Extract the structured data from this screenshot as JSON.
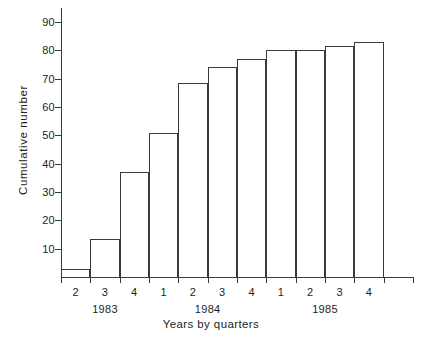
{
  "chart_data": {
    "type": "bar",
    "title": "",
    "xlabel": "Years by quarters",
    "ylabel": "Cumulative number",
    "categories": [
      "2",
      "3",
      "4",
      "1",
      "2",
      "3",
      "4",
      "1",
      "2",
      "3",
      "4"
    ],
    "group_labels": [
      "1983",
      "1984",
      "1985"
    ],
    "groups": [
      {
        "label": "1983",
        "quarters": [
          "2",
          "3",
          "4"
        ]
      },
      {
        "label": "1984",
        "quarters": [
          "1",
          "2",
          "3",
          "4"
        ]
      },
      {
        "label": "1985",
        "quarters": [
          "1",
          "2",
          "3",
          "4"
        ]
      }
    ],
    "values": [
      3,
      13.5,
      37,
      51,
      68.5,
      74,
      77,
      80,
      80,
      81.5,
      83
    ],
    "ylim": [
      0,
      95
    ],
    "yticks": [
      10,
      20,
      30,
      40,
      50,
      60,
      70,
      80,
      90
    ],
    "ytick_labels": [
      "10",
      "20",
      "30",
      "40",
      "50",
      "60",
      "70",
      "80",
      "90"
    ],
    "grid": false,
    "legend": "none",
    "bar_fill": "#ffffff",
    "bar_stroke": "#3a3a3a",
    "axis_color": "#3a3a3a",
    "text_color": "#1d1d1d",
    "background": "#ffffff"
  }
}
